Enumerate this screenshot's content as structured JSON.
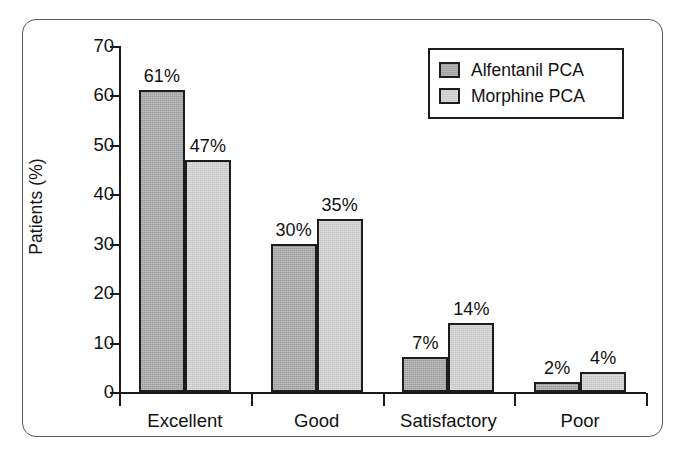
{
  "chart_data": {
    "type": "bar",
    "title": "",
    "xlabel": "",
    "ylabel": "Patients (%)",
    "ylim": [
      0,
      70
    ],
    "yticks": [
      0,
      10,
      20,
      30,
      40,
      50,
      60,
      70
    ],
    "ytick_labels": [
      "0",
      "10",
      "20",
      "30",
      "40",
      "50",
      "60",
      "70"
    ],
    "grid": false,
    "legend_position": "top-right",
    "categories": [
      "Excellent",
      "Good",
      "Satisfactory",
      "Poor"
    ],
    "series": [
      {
        "name": "Alfentanil PCA",
        "color": "#a9a9a9",
        "values": [
          61,
          30,
          7,
          2
        ],
        "value_labels": [
          "61%",
          "30%",
          "7%",
          "2%"
        ]
      },
      {
        "name": "Morphine PCA",
        "color": "#d2d2d2",
        "values": [
          47,
          35,
          14,
          4
        ],
        "value_labels": [
          "47%",
          "35%",
          "14%",
          "4%"
        ]
      }
    ]
  },
  "legend": {
    "entries": [
      {
        "label": "Alfentanil PCA",
        "swatch": "dark-gray-swatch"
      },
      {
        "label": "Morphine PCA",
        "swatch": "light-gray-swatch"
      }
    ]
  },
  "colors": {
    "series_alfentanil": "#a9a9a9",
    "series_morphine": "#d2d2d2",
    "axis": "#1a1a1a",
    "frame": "#595959",
    "background": "#ffffff"
  }
}
